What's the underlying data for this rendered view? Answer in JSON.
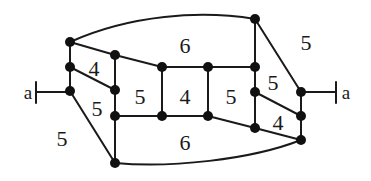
{
  "diagram": {
    "type": "planar-graph",
    "colors": {
      "stroke": "#1a1a1a",
      "vertex": "#111111",
      "background": "#ffffff"
    },
    "terminals": [
      {
        "id": "left-terminal",
        "label": "a",
        "x": 28,
        "y": 92
      },
      {
        "id": "right-terminal",
        "label": "a",
        "x": 346,
        "y": 92
      }
    ],
    "face_labels": [
      {
        "id": "face-top",
        "label": "6",
        "x": 185,
        "y": 45
      },
      {
        "id": "face-left-upper",
        "label": "4",
        "x": 94,
        "y": 68
      },
      {
        "id": "face-left-middle",
        "label": "5",
        "x": 97,
        "y": 108
      },
      {
        "id": "face-center-left",
        "label": "5",
        "x": 140,
        "y": 96
      },
      {
        "id": "face-center",
        "label": "4",
        "x": 185,
        "y": 96
      },
      {
        "id": "face-center-right",
        "label": "5",
        "x": 231,
        "y": 96
      },
      {
        "id": "face-right-upper",
        "label": "5",
        "x": 273,
        "y": 82
      },
      {
        "id": "face-right-lower",
        "label": "4",
        "x": 278,
        "y": 122
      },
      {
        "id": "face-bottom",
        "label": "6",
        "x": 185,
        "y": 142
      },
      {
        "id": "face-outer-left",
        "label": "5",
        "x": 62,
        "y": 138
      },
      {
        "id": "face-outer-right",
        "label": "5",
        "x": 306,
        "y": 42
      }
    ]
  }
}
